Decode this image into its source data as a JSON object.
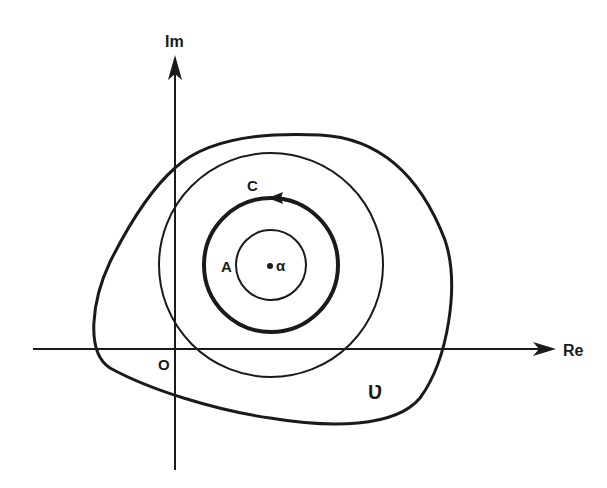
{
  "diagram": {
    "type": "complex-plane-contour-diagram",
    "colors": {
      "background": "#ffffff",
      "ink": "#1a1a1a"
    },
    "axes": {
      "real_label": "Re",
      "imag_label": "Im",
      "origin_label": "O"
    },
    "labels": {
      "region": "Ʋ",
      "contour_c": "C",
      "disk_a": "A",
      "point_alpha": "α"
    }
  }
}
